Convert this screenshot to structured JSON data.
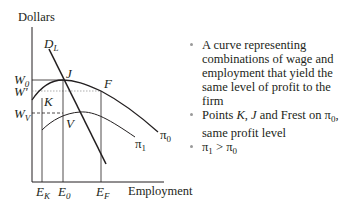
{
  "diagram": {
    "y_axis_label": "Dollars",
    "x_axis_label": "Employment",
    "wage_labels": {
      "w0": {
        "base": "W",
        "sub": "0"
      },
      "w_prime": {
        "base": "W'"
      },
      "wv": {
        "base": "W",
        "sub": "V"
      }
    },
    "employment_labels": {
      "ek": {
        "base": "E",
        "sub": "K"
      },
      "e0": {
        "base": "E",
        "sub": "0"
      },
      "ef": {
        "base": "E",
        "sub": "F"
      }
    },
    "curve_labels": {
      "demand": {
        "base": "D",
        "sub": "L"
      },
      "pi0": {
        "base": "π",
        "sub": "0"
      },
      "pi1": {
        "base": "π",
        "sub": "1"
      }
    },
    "points": {
      "j": "J",
      "k": "K",
      "f": "F",
      "v": "V"
    },
    "colors": {
      "line": "#231f20",
      "guide": "#555555"
    }
  },
  "bullets": [
    {
      "text": "A curve representing combinations of wage and employment that yield the same level of profit to the firm"
    },
    {
      "prefix": "Points ",
      "k": "K",
      "sep1": ", ",
      "j": "J",
      "mid": " and Frest on ",
      "pi": "π",
      "pi_sub": "0",
      "suffix": ", same profit level"
    },
    {
      "a": "π",
      "a_sub": "1",
      "op": " > ",
      "b": "π",
      "b_sub": "0"
    }
  ]
}
